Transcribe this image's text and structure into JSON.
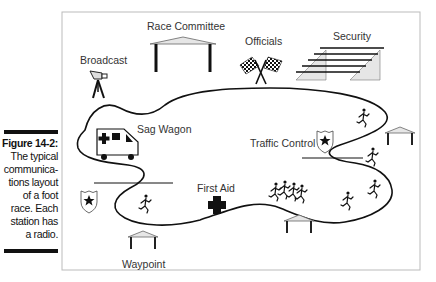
{
  "caption": {
    "figure_label": "Figure 14-2:",
    "text_lines": [
      "The typical",
      "communica-",
      "tions layout",
      "of a foot",
      "race. Each",
      "station has",
      "a radio."
    ]
  },
  "diagram": {
    "stations": {
      "race_committee": "Race Committee",
      "officials": "Officials",
      "security": "Security",
      "broadcast": "Broadcast",
      "sag_wagon": "Sag Wagon",
      "traffic_control": "Traffic Control",
      "first_aid": "First Aid",
      "waypoint": "Waypoint"
    },
    "colors": {
      "line": "#111111",
      "shelter_fill": "#e6e6e6",
      "frame": "#bbbbbb"
    }
  }
}
